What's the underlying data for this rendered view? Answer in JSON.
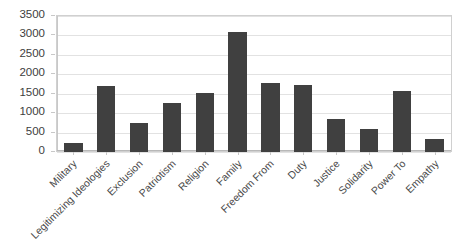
{
  "chart_data": {
    "type": "bar",
    "title": "",
    "xlabel": "",
    "ylabel": "",
    "ylim": [
      0,
      3500
    ],
    "ytick_step": 500,
    "yticks": [
      "0",
      "500",
      "1000",
      "1500",
      "2000",
      "2500",
      "3000",
      "3500"
    ],
    "grid": true,
    "legend": "none",
    "bar_color": "#404040",
    "categories": [
      "Military",
      "Legitimizing Ideologies",
      "Exclusion",
      "Patriotism",
      "Religion",
      "Family",
      "Freedom From",
      "Duty",
      "Justice",
      "Solidarity",
      "Power To",
      "Empathy"
    ],
    "values": [
      230,
      1700,
      740,
      1250,
      1520,
      3100,
      1780,
      1730,
      840,
      590,
      1580,
      330
    ],
    "series": [
      {
        "name": "Frequency",
        "values": [
          230,
          1700,
          740,
          1250,
          1520,
          3100,
          1780,
          1730,
          840,
          590,
          1580,
          330
        ]
      }
    ]
  },
  "colors": {
    "bar": "#404040",
    "grid": "#e2e2e2",
    "axis": "#c8c8c8",
    "text": "#3d3d3d",
    "background": "#ffffff"
  }
}
